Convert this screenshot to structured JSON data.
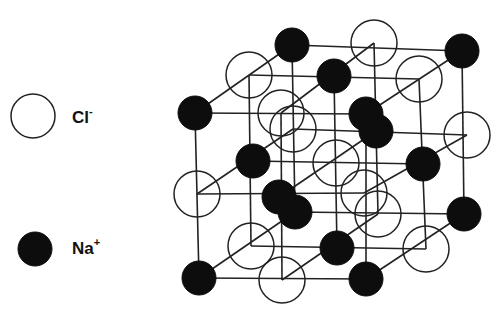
{
  "diagram": {
    "colors": {
      "na_fill": "#0d0d0d",
      "cl_fill": "#ffffff",
      "line": "#222222"
    }
  },
  "legend": [
    {
      "symbol": "Cl",
      "charge": "-",
      "style": "open-circle"
    },
    {
      "symbol": "Na",
      "charge": "+",
      "style": "filled-circle"
    }
  ],
  "lattice": {
    "dimensions": [
      3,
      3,
      3
    ],
    "rule": "ion at (i,j,k) is Na if (i+j+k) is even, else Cl",
    "sites": [
      {
        "i": 0,
        "j": 0,
        "k": 0,
        "ion": "Na"
      },
      {
        "i": 1,
        "j": 0,
        "k": 0,
        "ion": "Cl"
      },
      {
        "i": 2,
        "j": 0,
        "k": 0,
        "ion": "Na"
      },
      {
        "i": 0,
        "j": 1,
        "k": 0,
        "ion": "Cl"
      },
      {
        "i": 1,
        "j": 1,
        "k": 0,
        "ion": "Na"
      },
      {
        "i": 2,
        "j": 1,
        "k": 0,
        "ion": "Cl"
      },
      {
        "i": 0,
        "j": 2,
        "k": 0,
        "ion": "Na"
      },
      {
        "i": 1,
        "j": 2,
        "k": 0,
        "ion": "Cl"
      },
      {
        "i": 2,
        "j": 2,
        "k": 0,
        "ion": "Na"
      },
      {
        "i": 0,
        "j": 0,
        "k": 1,
        "ion": "Cl"
      },
      {
        "i": 1,
        "j": 0,
        "k": 1,
        "ion": "Na"
      },
      {
        "i": 2,
        "j": 0,
        "k": 1,
        "ion": "Cl"
      },
      {
        "i": 0,
        "j": 1,
        "k": 1,
        "ion": "Na"
      },
      {
        "i": 1,
        "j": 1,
        "k": 1,
        "ion": "Cl"
      },
      {
        "i": 2,
        "j": 1,
        "k": 1,
        "ion": "Na"
      },
      {
        "i": 0,
        "j": 2,
        "k": 1,
        "ion": "Cl"
      },
      {
        "i": 1,
        "j": 2,
        "k": 1,
        "ion": "Na"
      },
      {
        "i": 2,
        "j": 2,
        "k": 1,
        "ion": "Cl"
      },
      {
        "i": 0,
        "j": 0,
        "k": 2,
        "ion": "Na"
      },
      {
        "i": 1,
        "j": 0,
        "k": 2,
        "ion": "Cl"
      },
      {
        "i": 2,
        "j": 0,
        "k": 2,
        "ion": "Na"
      },
      {
        "i": 0,
        "j": 1,
        "k": 2,
        "ion": "Cl"
      },
      {
        "i": 1,
        "j": 1,
        "k": 2,
        "ion": "Na"
      },
      {
        "i": 2,
        "j": 1,
        "k": 2,
        "ion": "Cl"
      },
      {
        "i": 0,
        "j": 2,
        "k": 2,
        "ion": "Na"
      },
      {
        "i": 1,
        "j": 2,
        "k": 2,
        "ion": "Cl"
      },
      {
        "i": 2,
        "j": 2,
        "k": 2,
        "ion": "Na"
      }
    ]
  }
}
